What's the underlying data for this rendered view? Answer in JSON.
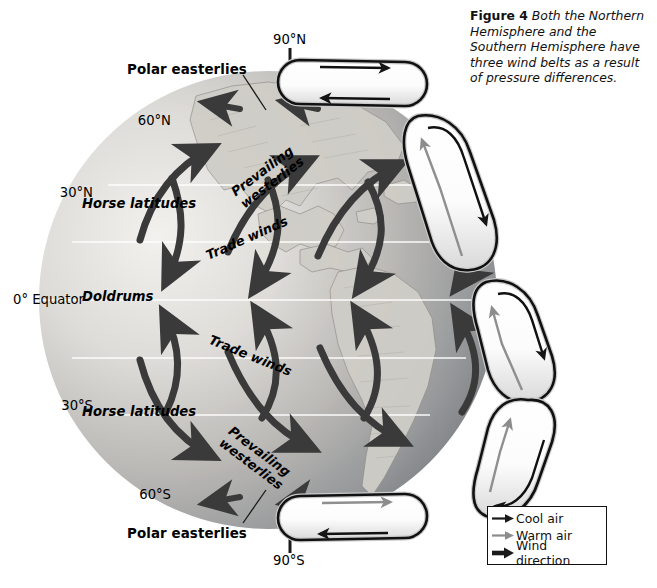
{
  "figure": {
    "label": "Figure 4",
    "caption": "Both the Northern Hemisphere and the Southern Hemisphere have three wind belts as a result of pressure differences."
  },
  "latitudes": [
    {
      "id": "lat-90n",
      "label": "90°N"
    },
    {
      "id": "lat-60n",
      "label": "60°N"
    },
    {
      "id": "lat-30n",
      "label": "30°N"
    },
    {
      "id": "lat-0",
      "label": "0° Equator"
    },
    {
      "id": "lat-30s",
      "label": "30°S"
    },
    {
      "id": "lat-60s",
      "label": "60°S"
    },
    {
      "id": "lat-90s",
      "label": "90°S"
    }
  ],
  "callouts": {
    "polar_easterlies_north": "Polar easterlies",
    "polar_easterlies_south": "Polar easterlies"
  },
  "belts": {
    "horse_latitudes_north": "Horse latitudes",
    "horse_latitudes_south": "Horse latitudes",
    "doldrums": "Doldrums",
    "prevailing_westerlies_north_line1": "Prevailing",
    "prevailing_westerlies_north_line2": "westerlies",
    "prevailing_westerlies_south_line1": "Prevailing",
    "prevailing_westerlies_south_line2": "westerlies",
    "trade_winds_north": "Trade winds",
    "trade_winds_south": "Trade winds"
  },
  "legend": {
    "items": [
      {
        "icon": "thin-dark-arrow-icon",
        "label": "Cool air",
        "color": "#1a1a1a"
      },
      {
        "icon": "thin-gray-arrow-icon",
        "label": "Warm air",
        "color": "#8c8c8c"
      },
      {
        "icon": "thick-dark-arrow-icon",
        "label": "Wind direction",
        "color": "#1a1a1a"
      }
    ]
  },
  "colors": {
    "globe_light": "#e9e7e3",
    "globe_mid": "#b9b7b4",
    "globe_dark": "#7e8184",
    "arrow": "#3a3a3a",
    "cell_outline": "#111111",
    "cell_fill": "#ffffff",
    "latline": "#ffffff"
  }
}
